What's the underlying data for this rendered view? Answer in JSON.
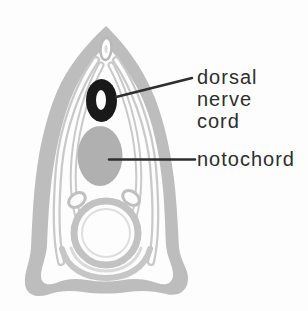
{
  "labels": {
    "dorsal_nerve_cord_lines": [
      "dorsal",
      "nerve",
      "cord"
    ],
    "notochord": "notochord"
  },
  "colors": {
    "background": "#fdfdfd",
    "body_wall_gray": "#bdbdbd",
    "myotome_gray": "#c9c9c9",
    "notochord_gray": "#b0b0b0",
    "nerve_cord_black": "#191919",
    "canal_white": "#fdfdfd",
    "gut_ring_gray": "#c2c2c2",
    "atrium_arc_gray": "#c6c6c6",
    "leader_line": "#2e2e2e",
    "label_text": "#2e2e2e"
  }
}
